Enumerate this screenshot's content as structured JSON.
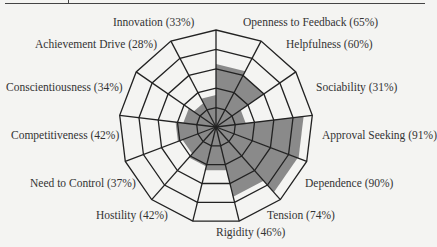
{
  "chart_data": {
    "type": "radar",
    "title": "",
    "categories": [
      "Innovation",
      "Openness to Feedback",
      "Helpfulness",
      "Sociability",
      "Approval Seeking",
      "Dependence",
      "Tension",
      "Rigidity",
      "Hostility",
      "Need to Control",
      "Competitiveness",
      "Conscientiousness",
      "Achievement Drive"
    ],
    "values": [
      33,
      65,
      60,
      31,
      91,
      90,
      74,
      46,
      42,
      37,
      42,
      34,
      28
    ],
    "unit": "%",
    "rings": 5,
    "range": [
      0,
      100
    ],
    "fill_color": "#8a8a8a",
    "grid_color": "#222222"
  },
  "labels": [
    {
      "text": "Innovation (33%)"
    },
    {
      "text": "Openness to Feedback (65%)"
    },
    {
      "text": "Helpfulness (60%)"
    },
    {
      "text": "Sociability (31%)"
    },
    {
      "text": "Approval Seeking (91%)"
    },
    {
      "text": "Dependence (90%)"
    },
    {
      "text": "Tension (74%)"
    },
    {
      "text": "Rigidity (46%)"
    },
    {
      "text": "Hostility (42%)"
    },
    {
      "text": "Need to Control (37%)"
    },
    {
      "text": "Competitiveness (42%)"
    },
    {
      "text": "Conscientiousness (34%)"
    },
    {
      "text": "Achievement Drive (28%)"
    }
  ]
}
